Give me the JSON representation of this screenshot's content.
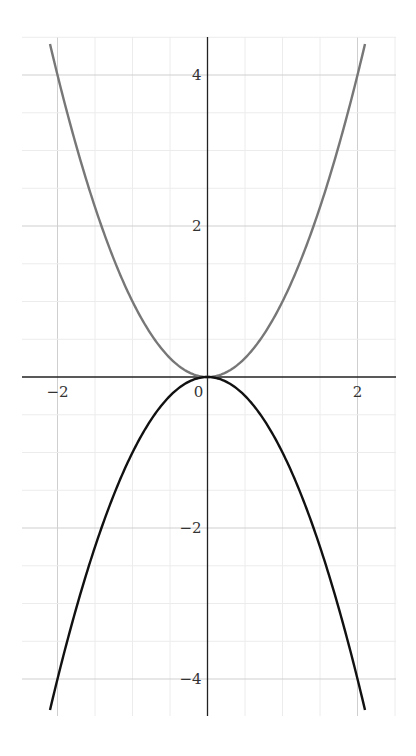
{
  "chart_data": {
    "type": "line",
    "title": "",
    "xlabel": "",
    "ylabel": "",
    "xlim": [
      -2.47,
      2.5
    ],
    "ylim": [
      -4.5,
      4.5
    ],
    "grid": true,
    "grid_minor_step": 0.5,
    "x_ticks": [
      -2,
      0,
      2
    ],
    "x_tick_labels": [
      "−2",
      "0",
      "2"
    ],
    "y_ticks": [
      -4,
      -2,
      2,
      4
    ],
    "y_tick_labels": [
      "−4",
      "−2",
      "2",
      "4"
    ],
    "series": [
      {
        "name": "y = x^2",
        "color": "#777777",
        "x_range": [
          -2.1,
          2.1
        ],
        "formula": "x^2"
      },
      {
        "name": "y = -x^2",
        "color": "#111111",
        "x_range": [
          -2.1,
          2.1
        ],
        "formula": "-x^2"
      }
    ]
  }
}
